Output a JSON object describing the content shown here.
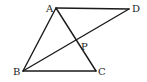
{
  "diagram": {
    "type": "geometry",
    "points": {
      "A": {
        "label": "A",
        "x": 56,
        "y": 8,
        "lx": 46,
        "ly": 12
      },
      "B": {
        "label": "B",
        "x": 23,
        "y": 71,
        "lx": 13,
        "ly": 75
      },
      "C": {
        "label": "C",
        "x": 96,
        "y": 71,
        "lx": 98,
        "ly": 75
      },
      "D": {
        "label": "D",
        "x": 129,
        "y": 9,
        "lx": 132,
        "ly": 12
      },
      "P": {
        "label": "P",
        "x": 76,
        "y": 40,
        "lx": 81,
        "ly": 50
      }
    },
    "segments": [
      {
        "name": "AD",
        "from": "A",
        "to": "D"
      },
      {
        "name": "AB",
        "from": "A",
        "to": "B"
      },
      {
        "name": "AC",
        "from": "A",
        "to": "C"
      },
      {
        "name": "BC",
        "from": "B",
        "to": "C"
      },
      {
        "name": "BD",
        "from": "B",
        "to": "D"
      }
    ],
    "colors": {
      "stroke": "#1a1a1a",
      "label": "#222222",
      "background": "#ffffff"
    }
  }
}
